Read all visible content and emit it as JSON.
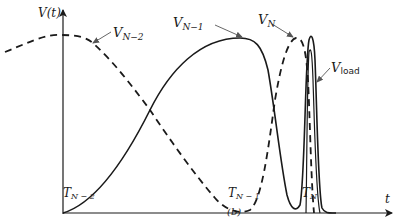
{
  "figure": {
    "caption": "(b)",
    "y_axis_label": "V(t)",
    "x_axis_label": "t",
    "ticks": [
      {
        "main": "T",
        "sub": "N − 2"
      },
      {
        "main": "T",
        "sub": "N − 1"
      },
      {
        "main": "T",
        "sub": "N"
      }
    ],
    "curves": [
      {
        "main": "V",
        "sub": "N−2",
        "style": "dashed"
      },
      {
        "main": "V",
        "sub": "N−1",
        "style": "solid"
      },
      {
        "main": "V",
        "sub": "N",
        "style": "dashed"
      },
      {
        "main": "V",
        "sub": "load",
        "style": "solid"
      }
    ],
    "colors": {
      "ink": "#1a1a1a",
      "background": "#ffffff"
    }
  }
}
